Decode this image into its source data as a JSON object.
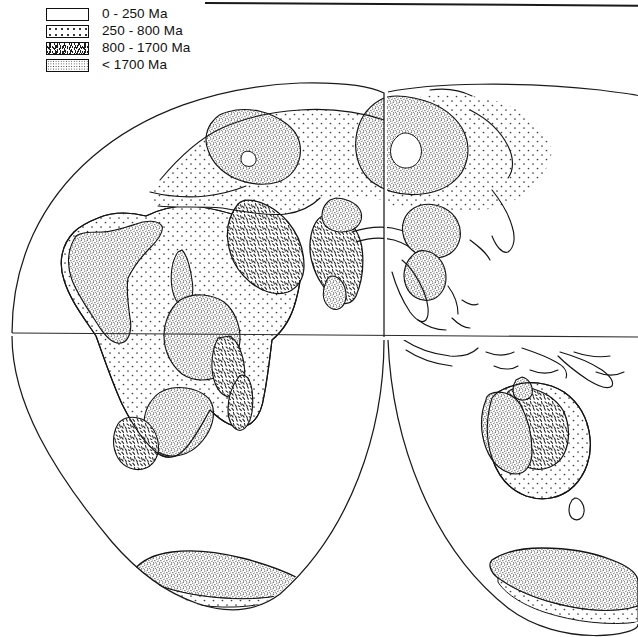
{
  "figure": {
    "projection": "interrupted equal-area (Goode homolosine style)",
    "background_color": "#ffffff",
    "line_color": "#141414"
  },
  "top_rule": {
    "name": "horizontal rule"
  },
  "legend": {
    "title": "",
    "items": [
      {
        "label": "0 - 250 Ma",
        "pattern": "blank",
        "range_min_ma": 0,
        "range_max_ma": 250
      },
      {
        "label": "250 - 800 Ma",
        "pattern": "dots",
        "range_min_ma": 250,
        "range_max_ma": 800
      },
      {
        "label": "800 - 1700 Ma",
        "pattern": "dash",
        "range_min_ma": 800,
        "range_max_ma": 1700
      },
      {
        "label": "< 1700 Ma",
        "pattern": "stipple",
        "range_min_ma": 1700,
        "range_max_ma": null
      }
    ]
  },
  "map": {
    "equator_label": "equator",
    "lobes": [
      {
        "name": "western-lobe",
        "central_meridian_deg": 20
      },
      {
        "name": "eastern-lobe",
        "central_meridian_deg": 140
      }
    ],
    "regions": [
      {
        "name": "africa",
        "age_class": "< 1700 Ma"
      },
      {
        "name": "arabia",
        "age_class": "800 - 1700 Ma"
      },
      {
        "name": "india",
        "age_class": "800 - 1700 Ma"
      },
      {
        "name": "baltic-shield",
        "age_class": "< 1700 Ma"
      },
      {
        "name": "siberian-craton",
        "age_class": "< 1700 Ma"
      },
      {
        "name": "east-european-plain",
        "age_class": "250 - 800 Ma"
      },
      {
        "name": "west-siberian-basin",
        "age_class": "250 - 800 Ma"
      },
      {
        "name": "china-craton",
        "age_class": "< 1700 Ma"
      },
      {
        "name": "australia-west",
        "age_class": "< 1700 Ma"
      },
      {
        "name": "australia-centre",
        "age_class": "800 - 1700 Ma"
      },
      {
        "name": "australia-east",
        "age_class": "250 - 800 Ma"
      },
      {
        "name": "antarctica",
        "age_class": "< 1700 Ma"
      },
      {
        "name": "madagascar",
        "age_class": "800 - 1700 Ma"
      },
      {
        "name": "southeast-asia",
        "age_class": "0 - 250 Ma"
      },
      {
        "name": "indonesia",
        "age_class": "0 - 250 Ma"
      },
      {
        "name": "japan",
        "age_class": "0 - 250 Ma"
      }
    ]
  }
}
